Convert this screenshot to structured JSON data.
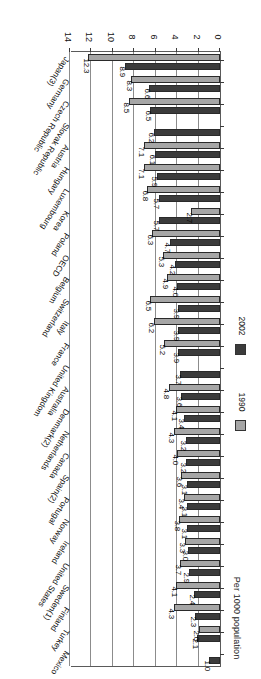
{
  "chart": {
    "type": "bar",
    "orientation": "horizontal",
    "ylabel": "Per 1000 population",
    "xlabel": "",
    "title": "",
    "grid": true,
    "legend_position": "left",
    "xlim": [
      0,
      14
    ],
    "xticks": [
      "0",
      "2",
      "4",
      "6",
      "8",
      "10",
      "12",
      "14"
    ],
    "legend": [
      {
        "name": "1990",
        "color": "#a6a6a6"
      },
      {
        "name": "2002",
        "color": "#3b3b3b"
      }
    ]
  },
  "chart_data": {
    "type": "bar",
    "title": "",
    "xlabel": "",
    "ylabel": "Per 1000 population",
    "xlim": [
      0,
      14
    ],
    "xticks": [
      0,
      2,
      4,
      6,
      8,
      10,
      12,
      14
    ],
    "grid": true,
    "legend": [
      "1990",
      "2002"
    ],
    "legend_position": "left",
    "categories": [
      "Mexico",
      "Turkey",
      "Finland",
      "Sweden(1)",
      "United States",
      "Ireland",
      "Norway",
      "Portugal",
      "Spain(2)",
      "Canada",
      "Netherlands",
      "Denmark(2)",
      "Australia",
      "United Kingdom",
      "France",
      "Italy",
      "Switzerland",
      "Belgium",
      "OECD",
      "Poland",
      "Korea",
      "Luxembourg",
      "Hungary",
      "Austria",
      "Slovak Republic",
      "Czech Republic",
      "Germany",
      "Japan(3)"
    ],
    "series": [
      {
        "name": "1990",
        "color": "#a6a6a6",
        "values": [
          null,
          2.0,
          4.3,
          4.1,
          3.7,
          3.3,
          3.8,
          3.4,
          3.6,
          4.0,
          4.3,
          4.1,
          4.8,
          null,
          5.2,
          6.2,
          6.5,
          4.9,
          5.3,
          6.3,
          2.7,
          6.8,
          7.1,
          7.1,
          null,
          8.5,
          8.3,
          12.3
        ]
      },
      {
        "name": "2002",
        "color": "#3b3b3b",
        "values": [
          1.0,
          2.1,
          2.3,
          2.4,
          2.9,
          3.0,
          3.1,
          3.1,
          3.1,
          3.2,
          3.2,
          3.4,
          3.6,
          3.7,
          3.9,
          3.9,
          3.9,
          4.0,
          4.2,
          4.7,
          5.7,
          5.7,
          5.9,
          6.1,
          6.2,
          6.5,
          6.6,
          8.9
        ]
      }
    ],
    "value_labels": {
      "Mexico": {
        "1990": "",
        "2002": "1.0"
      },
      "Turkey": {
        "1990": "2.0",
        "2002": "2.1"
      },
      "Finland": {
        "1990": "4.3",
        "2002": "2.3"
      },
      "Sweden(1)": {
        "1990": "4.1",
        "2002": "2.4"
      },
      "United States": {
        "1990": "3.7",
        "2002": "2.9"
      },
      "Ireland": {
        "1990": "3.3",
        "2002": "3.0"
      },
      "Norway": {
        "1990": "3.8",
        "2002": "3.1"
      },
      "Portugal": {
        "1990": "3.4",
        "2002": "3.1"
      },
      "Spain(2)": {
        "1990": "3.6",
        "2002": "3.1"
      },
      "Canada": {
        "1990": "4.0",
        "2002": "3.2"
      },
      "Netherlands": {
        "1990": "4.3",
        "2002": "3.2"
      },
      "Denmark(2)": {
        "1990": "4.1",
        "2002": "3.4"
      },
      "Australia": {
        "1990": "4.8",
        "2002": "3.6"
      },
      "United Kingdom": {
        "1990": "",
        "2002": "3.7"
      },
      "France": {
        "1990": "5.2",
        "2002": "3.9"
      },
      "Italy": {
        "1990": "6.2",
        "2002": "3.9"
      },
      "Switzerland": {
        "1990": "6.5",
        "2002": "3.9"
      },
      "Belgium": {
        "1990": "4.9",
        "2002": "4.0"
      },
      "OECD": {
        "1990": "5.3",
        "2002": "4.2"
      },
      "Poland": {
        "1990": "6.3",
        "2002": "4.7"
      },
      "Korea": {
        "1990": "2.7",
        "2002": "5.7"
      },
      "Luxembourg": {
        "1990": "6.8",
        "2002": "5.7"
      },
      "Hungary": {
        "1990": "7.1",
        "2002": "5.9"
      },
      "Austria": {
        "1990": "7.1",
        "2002": "6.1"
      },
      "Slovak Republic": {
        "1990": "",
        "2002": "6.2"
      },
      "Czech Republic": {
        "1990": "8.5",
        "2002": "6.5"
      },
      "Germany": {
        "1990": "8.3",
        "2002": "6.6"
      },
      "Japan(3)": {
        "1990": "12.3",
        "2002": "8.9"
      }
    }
  }
}
